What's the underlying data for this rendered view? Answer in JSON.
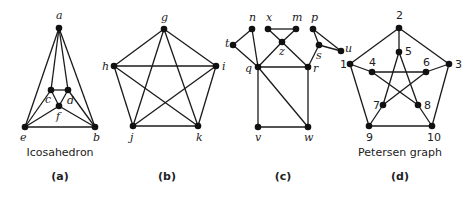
{
  "figure": {
    "colors": {
      "edge": "#1a1a1a",
      "vertex": "#111111",
      "text": "#222222",
      "background": "#ffffff"
    },
    "graphs": [
      {
        "id": "a",
        "caption": "(a)",
        "caption_pos": [
          60,
          180
        ],
        "name": "Icosahedron",
        "name_pos": [
          60,
          156
        ],
        "label_style": "italic",
        "vertices": [
          {
            "id": "a",
            "label": "a",
            "x": 59,
            "y": 28,
            "lx": 56,
            "ly": 19
          },
          {
            "id": "c",
            "label": "c",
            "x": 51,
            "y": 90,
            "lx": 45,
            "ly": 103
          },
          {
            "id": "d",
            "label": "d",
            "x": 68,
            "y": 90,
            "lx": 67,
            "ly": 104
          },
          {
            "id": "f",
            "label": "f",
            "x": 59,
            "y": 106,
            "lx": 56,
            "ly": 120
          },
          {
            "id": "e",
            "label": "e",
            "x": 25,
            "y": 127,
            "lx": 20,
            "ly": 141
          },
          {
            "id": "b",
            "label": "b",
            "x": 95,
            "y": 127,
            "lx": 93,
            "ly": 141
          }
        ],
        "edges": [
          [
            "a",
            "e"
          ],
          [
            "a",
            "b"
          ],
          [
            "a",
            "c"
          ],
          [
            "a",
            "d"
          ],
          [
            "c",
            "d"
          ],
          [
            "c",
            "f"
          ],
          [
            "d",
            "f"
          ],
          [
            "c",
            "e"
          ],
          [
            "d",
            "b"
          ],
          [
            "e",
            "f"
          ],
          [
            "f",
            "b"
          ],
          [
            "e",
            "b"
          ]
        ]
      },
      {
        "id": "b",
        "caption": "(b)",
        "caption_pos": [
          167,
          180
        ],
        "name": "",
        "label_style": "italic",
        "vertices": [
          {
            "id": "g",
            "label": "g",
            "x": 164,
            "y": 29,
            "lx": 161,
            "ly": 21
          },
          {
            "id": "h",
            "label": "h",
            "x": 114,
            "y": 66,
            "lx": 102,
            "ly": 70
          },
          {
            "id": "i",
            "label": "i",
            "x": 216,
            "y": 66,
            "lx": 222,
            "ly": 70
          },
          {
            "id": "j",
            "label": "j",
            "x": 133,
            "y": 126,
            "lx": 130,
            "ly": 141
          },
          {
            "id": "k",
            "label": "k",
            "x": 198,
            "y": 126,
            "lx": 196,
            "ly": 141
          }
        ],
        "edges": [
          [
            "g",
            "h"
          ],
          [
            "g",
            "i"
          ],
          [
            "g",
            "j"
          ],
          [
            "g",
            "k"
          ],
          [
            "h",
            "i"
          ],
          [
            "h",
            "j"
          ],
          [
            "h",
            "k"
          ],
          [
            "i",
            "j"
          ],
          [
            "i",
            "k"
          ],
          [
            "j",
            "k"
          ]
        ]
      },
      {
        "id": "c",
        "caption": "(c)",
        "caption_pos": [
          283,
          180
        ],
        "name": "",
        "label_style": "italic",
        "vertices": [
          {
            "id": "t",
            "label": "t",
            "x": 233,
            "y": 45,
            "lx": 225,
            "ly": 47
          },
          {
            "id": "n",
            "label": "n",
            "x": 252,
            "y": 29,
            "lx": 249,
            "ly": 21
          },
          {
            "id": "x",
            "label": "x",
            "x": 268,
            "y": 29,
            "lx": 266,
            "ly": 21
          },
          {
            "id": "m",
            "label": "m",
            "x": 296,
            "y": 29,
            "lx": 292,
            "ly": 21
          },
          {
            "id": "z",
            "label": "z",
            "x": 282,
            "y": 42,
            "lx": 279,
            "ly": 55
          },
          {
            "id": "p",
            "label": "p",
            "x": 313,
            "y": 29,
            "lx": 311,
            "ly": 21
          },
          {
            "id": "s",
            "label": "s",
            "x": 319,
            "y": 45,
            "lx": 316,
            "ly": 59
          },
          {
            "id": "u",
            "label": "u",
            "x": 341,
            "y": 51,
            "lx": 345,
            "ly": 52
          },
          {
            "id": "q",
            "label": "q",
            "x": 258,
            "y": 67,
            "lx": 245,
            "ly": 72
          },
          {
            "id": "r",
            "label": "r",
            "x": 308,
            "y": 67,
            "lx": 313,
            "ly": 72
          },
          {
            "id": "v",
            "label": "v",
            "x": 258,
            "y": 127,
            "lx": 255,
            "ly": 141
          },
          {
            "id": "w",
            "label": "w",
            "x": 308,
            "y": 127,
            "lx": 304,
            "ly": 141
          }
        ],
        "edges": [
          [
            "t",
            "n"
          ],
          [
            "t",
            "q"
          ],
          [
            "n",
            "q"
          ],
          [
            "x",
            "m"
          ],
          [
            "x",
            "z"
          ],
          [
            "m",
            "z"
          ],
          [
            "z",
            "q"
          ],
          [
            "z",
            "r"
          ],
          [
            "p",
            "s"
          ],
          [
            "p",
            "u"
          ],
          [
            "s",
            "u"
          ],
          [
            "s",
            "r"
          ],
          [
            "q",
            "r"
          ],
          [
            "q",
            "v"
          ],
          [
            "q",
            "w"
          ],
          [
            "r",
            "w"
          ],
          [
            "v",
            "w"
          ]
        ]
      },
      {
        "id": "d",
        "caption": "(d)",
        "caption_pos": [
          400,
          180
        ],
        "name": "Petersen graph",
        "name_pos": [
          400,
          156
        ],
        "label_style": "upright",
        "vertices": [
          {
            "id": "2",
            "label": "2",
            "x": 399,
            "y": 28,
            "lx": 396,
            "ly": 19
          },
          {
            "id": "1",
            "label": "1",
            "x": 350,
            "y": 64,
            "lx": 340,
            "ly": 68
          },
          {
            "id": "3",
            "label": "3",
            "x": 449,
            "y": 64,
            "lx": 455,
            "ly": 68
          },
          {
            "id": "9",
            "label": "9",
            "x": 369,
            "y": 126,
            "lx": 366,
            "ly": 141
          },
          {
            "id": "10",
            "label": "10",
            "x": 432,
            "y": 126,
            "lx": 427,
            "ly": 141
          },
          {
            "id": "5",
            "label": "5",
            "x": 399,
            "y": 52,
            "lx": 405,
            "ly": 55
          },
          {
            "id": "4",
            "label": "4",
            "x": 372,
            "y": 72,
            "lx": 369,
            "ly": 66
          },
          {
            "id": "6",
            "label": "6",
            "x": 426,
            "y": 72,
            "lx": 423,
            "ly": 66
          },
          {
            "id": "7",
            "label": "7",
            "x": 383,
            "y": 105,
            "lx": 373,
            "ly": 109
          },
          {
            "id": "8",
            "label": "8",
            "x": 418,
            "y": 105,
            "lx": 424,
            "ly": 109
          }
        ],
        "edges": [
          [
            "1",
            "2"
          ],
          [
            "2",
            "3"
          ],
          [
            "3",
            "10"
          ],
          [
            "10",
            "9"
          ],
          [
            "9",
            "1"
          ],
          [
            "2",
            "5"
          ],
          [
            "1",
            "4"
          ],
          [
            "3",
            "6"
          ],
          [
            "9",
            "7"
          ],
          [
            "10",
            "8"
          ],
          [
            "5",
            "7"
          ],
          [
            "5",
            "8"
          ],
          [
            "4",
            "6"
          ],
          [
            "4",
            "8"
          ],
          [
            "6",
            "7"
          ]
        ]
      }
    ]
  }
}
